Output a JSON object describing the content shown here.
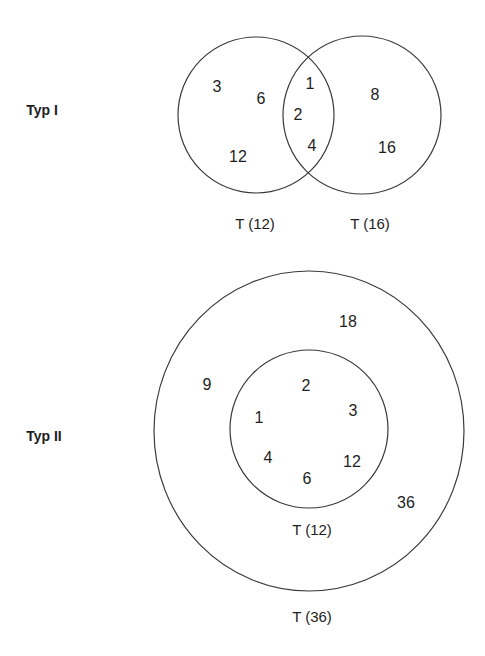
{
  "typ1": {
    "label": "Typ I",
    "left_circle": {
      "label": "T (12)",
      "only_items": [
        "3",
        "6",
        "12"
      ]
    },
    "right_circle": {
      "label": "T (16)",
      "only_items": [
        "8",
        "16"
      ]
    },
    "intersection_items": [
      "1",
      "2",
      "4"
    ]
  },
  "typ2": {
    "label": "Typ II",
    "outer_circle": {
      "label": "T (36)",
      "only_items": [
        "18",
        "9",
        "36"
      ]
    },
    "inner_circle": {
      "label": "T (12)",
      "items": [
        "2",
        "1",
        "3",
        "4",
        "12",
        "6"
      ]
    }
  },
  "colors": {
    "stroke": "#3a3a3a",
    "text": "#1e1e1e",
    "background": "#ffffff"
  }
}
